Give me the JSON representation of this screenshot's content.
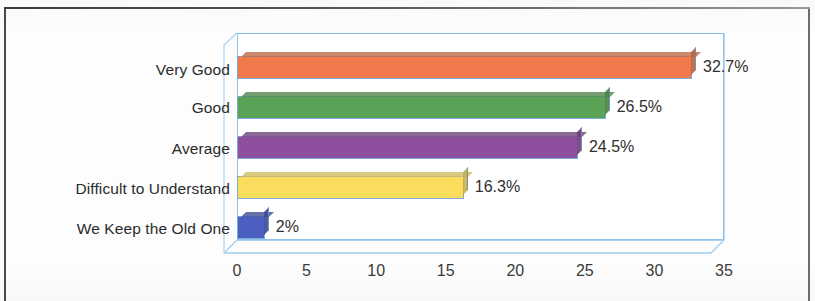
{
  "chart_data": {
    "type": "bar",
    "orientation": "horizontal",
    "title": "",
    "subtitle": "",
    "xlabel": "",
    "ylabel": "",
    "categories": [
      "Very Good",
      "Good",
      "Average",
      "Difficult to Understand",
      "We Keep the Old One"
    ],
    "values": [
      32.7,
      26.5,
      24.5,
      16.3,
      2
    ],
    "data_labels": [
      "32.7%",
      "26.5%",
      "24.5%",
      "16.3%",
      "2%"
    ],
    "colors": [
      "#f07a4b",
      "#5aa356",
      "#8e4f9e",
      "#fbdd5e",
      "#4a5fc1"
    ],
    "xlim": [
      0,
      35
    ],
    "xticks": [
      0,
      5,
      10,
      15,
      20,
      25,
      30,
      35
    ],
    "xtick_labels": [
      "0",
      "5",
      "10",
      "15",
      "20",
      "25",
      "30",
      "35"
    ],
    "grid": false,
    "legend": false,
    "legend_position": "none",
    "style_3d": true,
    "plot_border_color": "#8ec3ec"
  },
  "axis": {
    "tick_labels": [
      "0",
      "5",
      "10",
      "15",
      "20",
      "25",
      "30",
      "35"
    ]
  },
  "series": [
    {
      "category": "Very Good",
      "value": 32.7,
      "label": "32.7%",
      "color": "#f07a4b"
    },
    {
      "category": "Good",
      "value": 26.5,
      "label": "26.5%",
      "color": "#5aa356"
    },
    {
      "category": "Average",
      "value": 24.5,
      "label": "24.5%",
      "color": "#8e4f9e"
    },
    {
      "category": "Difficult to Understand",
      "value": 16.3,
      "label": "16.3%",
      "color": "#fbdd5e"
    },
    {
      "category": "We Keep the Old One",
      "value": 2,
      "label": "2%",
      "color": "#4a5fc1"
    }
  ]
}
